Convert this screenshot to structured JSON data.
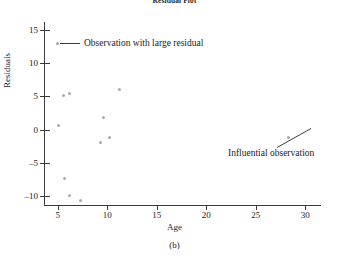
{
  "chart": {
    "title": "Residual Plot",
    "caption": "(b)",
    "xlabel": "Age",
    "ylabel": "Residuals",
    "legend_label": "Observation with large residual",
    "annotation_label": "Influential observation",
    "point_color": "#a9a9ac",
    "axis_color": "#3a3a3a"
  },
  "chart_data": {
    "type": "scatter",
    "title": "Residual Plot",
    "xlabel": "Age",
    "ylabel": "Residuals",
    "xlim": [
      3.6,
      31.6
    ],
    "ylim": [
      -11.5,
      16.2
    ],
    "xticks": [
      5,
      10,
      15,
      20,
      25,
      30
    ],
    "yticks": [
      -10,
      -5,
      0,
      5,
      10,
      15
    ],
    "grid": false,
    "legend_position": "upper-left-inside",
    "series": [
      {
        "name": "Observation with large residual",
        "marker": "dot",
        "color": "#a9a9ac",
        "points": [
          {
            "x": 5.1,
            "y": 0.6
          },
          {
            "x": 5.6,
            "y": 5.1
          },
          {
            "x": 6.2,
            "y": 5.4
          },
          {
            "x": 5.7,
            "y": -7.4
          },
          {
            "x": 6.2,
            "y": -9.9
          },
          {
            "x": 7.3,
            "y": -10.6
          },
          {
            "x": 9.3,
            "y": -2.0
          },
          {
            "x": 9.6,
            "y": 1.8
          },
          {
            "x": 10.2,
            "y": -1.2
          },
          {
            "x": 11.2,
            "y": 6.0
          },
          {
            "x": 28.3,
            "y": -1.2
          }
        ]
      }
    ],
    "annotations": [
      {
        "text": "Influential observation",
        "points_to": {
          "x": 28.3,
          "y": -1.2
        }
      }
    ]
  },
  "xticks": [
    {
      "value": 5,
      "label": "5"
    },
    {
      "value": 10,
      "label": "10"
    },
    {
      "value": 15,
      "label": "15"
    },
    {
      "value": 20,
      "label": "20"
    },
    {
      "value": 25,
      "label": "25"
    },
    {
      "value": 30,
      "label": "30"
    }
  ],
  "yticks": [
    {
      "value": 15,
      "label": "15"
    },
    {
      "value": 10,
      "label": "10"
    },
    {
      "value": 5,
      "label": "5"
    },
    {
      "value": 0,
      "label": "0"
    },
    {
      "value": -5,
      "label": "–5"
    },
    {
      "value": -10,
      "label": "–10"
    }
  ]
}
